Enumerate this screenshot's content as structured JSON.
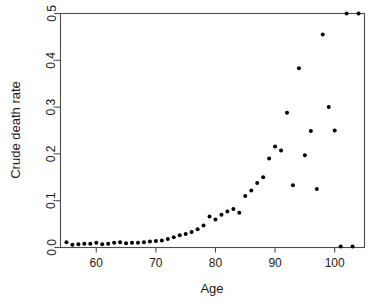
{
  "chart_data": {
    "type": "scatter",
    "title": "",
    "xlabel": "Age",
    "ylabel": "Crude death rate",
    "xlim": [
      54,
      105
    ],
    "ylim": [
      0.0,
      0.5
    ],
    "grid": false,
    "legend": null,
    "xticks": [
      60,
      70,
      80,
      90,
      100
    ],
    "xtick_labels": [
      "60",
      "70",
      "80",
      "90",
      "100"
    ],
    "yticks": [
      0.0,
      0.1,
      0.2,
      0.3,
      0.4,
      0.5
    ],
    "ytick_labels": [
      "0.0",
      "0.1",
      "0.2",
      "0.3",
      "0.4",
      "0.5"
    ],
    "marker": "point",
    "marker_color": "#000000",
    "marker_size": 2.0,
    "x": [
      55,
      56,
      57,
      58,
      59,
      60,
      61,
      62,
      63,
      64,
      65,
      66,
      67,
      68,
      69,
      70,
      71,
      72,
      73,
      74,
      75,
      76,
      77,
      78,
      79,
      80,
      81,
      82,
      83,
      84,
      85,
      86,
      87,
      88,
      89,
      90,
      91,
      92,
      93,
      94,
      95,
      96,
      97,
      98,
      99,
      100,
      101,
      102,
      103
    ],
    "y": [
      0.011,
      0.006,
      0.007,
      0.008,
      0.008,
      0.01,
      0.007,
      0.008,
      0.01,
      0.011,
      0.009,
      0.01,
      0.01,
      0.011,
      0.013,
      0.014,
      0.015,
      0.018,
      0.022,
      0.026,
      0.029,
      0.033,
      0.039,
      0.047,
      0.066,
      0.06,
      0.07,
      0.077,
      0.082,
      0.074,
      0.11,
      0.122,
      0.138,
      0.15,
      0.19,
      0.216,
      0.207,
      0.288,
      0.133,
      0.383,
      0.197,
      0.249,
      0.125,
      0.455,
      0.3,
      0.25,
      0.002,
      0.5,
      0.002
    ],
    "series": [
      {
        "name": "Crude death rate",
        "points": [
          {
            "age": 55,
            "rate": 0.011
          },
          {
            "age": 56,
            "rate": 0.006
          },
          {
            "age": 57,
            "rate": 0.007
          },
          {
            "age": 58,
            "rate": 0.008
          },
          {
            "age": 59,
            "rate": 0.008
          },
          {
            "age": 60,
            "rate": 0.01
          },
          {
            "age": 61,
            "rate": 0.007
          },
          {
            "age": 62,
            "rate": 0.008
          },
          {
            "age": 63,
            "rate": 0.01
          },
          {
            "age": 64,
            "rate": 0.011
          },
          {
            "age": 65,
            "rate": 0.009
          },
          {
            "age": 66,
            "rate": 0.01
          },
          {
            "age": 67,
            "rate": 0.01
          },
          {
            "age": 68,
            "rate": 0.011
          },
          {
            "age": 69,
            "rate": 0.013
          },
          {
            "age": 70,
            "rate": 0.014
          },
          {
            "age": 71,
            "rate": 0.015
          },
          {
            "age": 72,
            "rate": 0.018
          },
          {
            "age": 73,
            "rate": 0.022
          },
          {
            "age": 74,
            "rate": 0.026
          },
          {
            "age": 75,
            "rate": 0.029
          },
          {
            "age": 76,
            "rate": 0.033
          },
          {
            "age": 77,
            "rate": 0.039
          },
          {
            "age": 78,
            "rate": 0.047
          },
          {
            "age": 79,
            "rate": 0.066
          },
          {
            "age": 80,
            "rate": 0.06
          },
          {
            "age": 81,
            "rate": 0.07
          },
          {
            "age": 82,
            "rate": 0.077
          },
          {
            "age": 83,
            "rate": 0.082
          },
          {
            "age": 84,
            "rate": 0.074
          },
          {
            "age": 85,
            "rate": 0.11
          },
          {
            "age": 86,
            "rate": 0.122
          },
          {
            "age": 87,
            "rate": 0.138
          },
          {
            "age": 88,
            "rate": 0.15
          },
          {
            "age": 89,
            "rate": 0.19
          },
          {
            "age": 90,
            "rate": 0.216
          },
          {
            "age": 91,
            "rate": 0.207
          },
          {
            "age": 92,
            "rate": 0.288
          },
          {
            "age": 93,
            "rate": 0.133
          },
          {
            "age": 94,
            "rate": 0.383
          },
          {
            "age": 95,
            "rate": 0.197
          },
          {
            "age": 96,
            "rate": 0.249
          },
          {
            "age": 97,
            "rate": 0.125
          },
          {
            "age": 98,
            "rate": 0.455
          },
          {
            "age": 99,
            "rate": 0.3
          },
          {
            "age": 100,
            "rate": 0.25
          },
          {
            "age": 101,
            "rate": 0.002
          },
          {
            "age": 102,
            "rate": 0.5
          },
          {
            "age": 103,
            "rate": 0.002
          }
        ]
      }
    ],
    "extra_capped_point": {
      "age": 104,
      "rate": 0.5
    }
  }
}
